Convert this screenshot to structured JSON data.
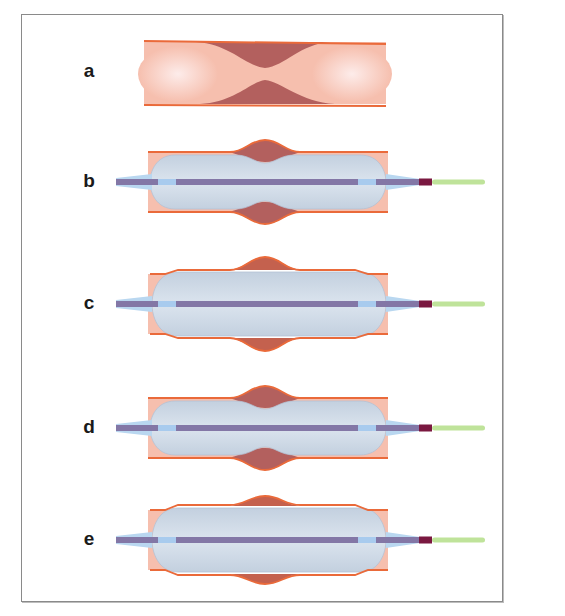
{
  "figure": {
    "panels": [
      {
        "label": "a",
        "description": "Stenosed vessel with plaque narrowing the lumen",
        "label_y": 72,
        "center_y": 74,
        "state": "stenosis"
      },
      {
        "label": "b",
        "description": "Balloon inflated; plaque bulges vessel wall outward with central waist",
        "label_y": 182,
        "center_y": 182,
        "state": "waist"
      },
      {
        "label": "c",
        "description": "Balloon fully expanded; plaque displaced outward, vessel wall stretched",
        "label_y": 304,
        "center_y": 304,
        "state": "expanded"
      },
      {
        "label": "d",
        "description": "Balloon with central waist; plaque compressing balloon",
        "label_y": 428,
        "center_y": 428,
        "state": "waist"
      },
      {
        "label": "e",
        "description": "Balloon fully expanded; plaque pushed outward",
        "label_y": 540,
        "center_y": 540,
        "state": "expanded-small"
      }
    ],
    "colors": {
      "vessel_fill": "#f6bfae",
      "vessel_highlight": "#fdecea",
      "vessel_wall": "#ea6a3a",
      "plaque": "#b3605e",
      "plaque_expanded": "#c4614e",
      "balloon": "#cdd9e6",
      "balloon_edge": "#b4c2d4",
      "shaft": "#8377a6",
      "marker": "#a8cbee",
      "tip_taper": "#b9d7f0",
      "hub": "#7a1840",
      "guidewire": "#bfe39a",
      "frame": "#8a8a8a"
    }
  }
}
